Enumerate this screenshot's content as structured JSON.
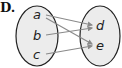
{
  "option_label": "D.",
  "domain_set": [
    "a",
    "b",
    "c"
  ],
  "range_set": [
    "d",
    "e"
  ],
  "mappings": [
    {
      "from": "a",
      "to": "d"
    },
    {
      "from": "a",
      "to": "e"
    },
    {
      "from": "b",
      "to": "d"
    },
    {
      "from": "c",
      "to": "e"
    }
  ],
  "colors": {
    "ellipse_fill": "#ececec",
    "ellipse_stroke": "#222222",
    "arrow": "#8a8a8a"
  }
}
